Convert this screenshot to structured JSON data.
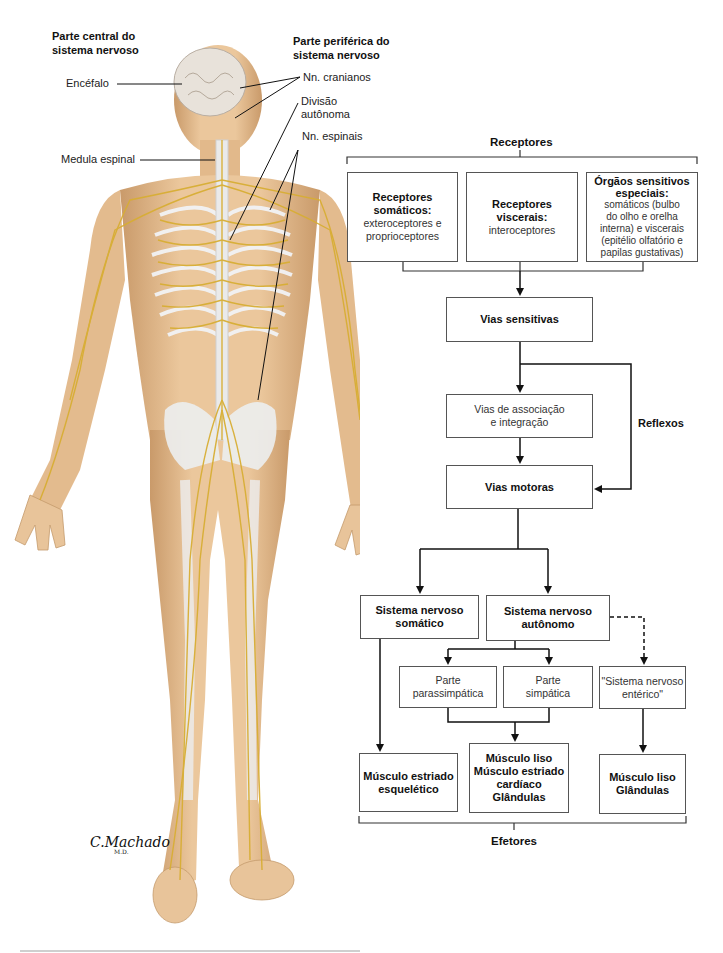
{
  "figure": {
    "title_central": "Parte central do\nsistema nervoso",
    "title_central_l1": "Parte central do",
    "title_central_l2": "sistema nervoso",
    "title_peripheral_l1": "Parte periférica do",
    "title_peripheral_l2": "sistema nervoso",
    "labels": {
      "encefalo": "Encéfalo",
      "medula": "Medula espinal",
      "cranianos": "Nn. cranianos",
      "divisao_l1": "Divisão",
      "divisao_l2": "autônoma",
      "espinais": "Nn. espinais"
    },
    "signature": "C.Machado",
    "signature_sub": "M.D.",
    "colors": {
      "skin": "#e8c49a",
      "skin_shadow": "#c99a6a",
      "bone": "#eef0f2",
      "nerve": "#d9b23a",
      "brain": "#e9e3dc"
    }
  },
  "flowchart": {
    "receptores_title": "Receptores",
    "receptor_boxes": [
      {
        "title_l1": "Receptores",
        "title_l2": "somáticos:",
        "body_l1": "exteroceptores e",
        "body_l2": "proprioceptores"
      },
      {
        "title_l1": "Receptores",
        "title_l2": "viscerais:",
        "body_l1": "interoceptores"
      },
      {
        "title_l1": "Órgãos sensitivos",
        "title_l2": "especiais:",
        "body_l1": "somáticos (bulbo",
        "body_l2": "do olho e orelha",
        "body_l3": "interna) e viscerais",
        "body_l4": "(epitélio olfatório e",
        "body_l5": "papilas gustativas)"
      }
    ],
    "vias_sensitivas": "Vias sensitivas",
    "vias_associacao_l1": "Vias de associação",
    "vias_associacao_l2": "e integração",
    "reflexos": "Reflexos",
    "vias_motoras": "Vias motoras",
    "sn_somatico_l1": "Sistema nervoso",
    "sn_somatico_l2": "somático",
    "sn_autonomo_l1": "Sistema nervoso",
    "sn_autonomo_l2": "autônomo",
    "parassimpatica_l1": "Parte",
    "parassimpatica_l2": "parassimpática",
    "simpatica_l1": "Parte",
    "simpatica_l2": "simpática",
    "enterico_l1": "\"Sistema nervoso",
    "enterico_l2": "entérico\"",
    "efetor_1_l1": "Músculo estriado",
    "efetor_1_l2": "esquelético",
    "efetor_2_l1": "Músculo liso",
    "efetor_2_l2": "Músculo estriado",
    "efetor_2_l3": "cardíaco",
    "efetor_2_l4": "Glândulas",
    "efetor_3_l1": "Músculo liso",
    "efetor_3_l2": "Glândulas",
    "efetores_title": "Efetores"
  }
}
